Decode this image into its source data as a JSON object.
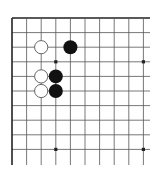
{
  "board": {
    "title": "Go board diagram (top-left corner)",
    "origin": {
      "x": 12,
      "y": 18
    },
    "spacing": 14.6,
    "cols": 10,
    "rows": 10,
    "line_extend_right": 150,
    "line_extend_bottom": 165,
    "edges": {
      "top": true,
      "left": true,
      "right": false,
      "bottom": false
    },
    "colors": {
      "line": "#555555",
      "edge": "#222222",
      "black_stone": "#111111",
      "white_stone": "#ffffff",
      "white_outline": "#555555",
      "background": "#ffffff"
    },
    "star_points": [
      {
        "col": 3,
        "row": 3
      },
      {
        "col": 9,
        "row": 3
      },
      {
        "col": 3,
        "row": 9
      },
      {
        "col": 9,
        "row": 9
      }
    ],
    "stones": [
      {
        "color": "white",
        "col": 2,
        "row": 2
      },
      {
        "color": "black",
        "col": 4,
        "row": 2
      },
      {
        "color": "white",
        "col": 2,
        "row": 4
      },
      {
        "color": "black",
        "col": 3,
        "row": 4
      },
      {
        "color": "white",
        "col": 2,
        "row": 5
      },
      {
        "color": "black",
        "col": 3,
        "row": 5
      }
    ]
  }
}
